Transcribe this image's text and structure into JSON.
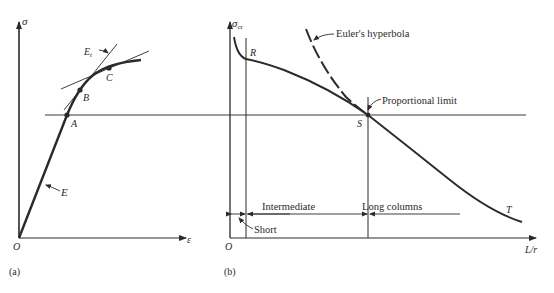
{
  "figure": {
    "panel_a": {
      "caption": "(a)",
      "y_axis_label": "σ",
      "x_axis_label": "ε",
      "origin_label": "O",
      "tangent_modulus_label": "Et",
      "elastic_modulus_label": "E",
      "points": [
        {
          "label": "A",
          "note": "proportional limit on stress-strain curve"
        },
        {
          "label": "B",
          "note": "tangent point"
        },
        {
          "label": "C",
          "note": "point on curve beyond B"
        }
      ]
    },
    "panel_b": {
      "caption": "(b)",
      "y_axis_label_main": "σ",
      "y_axis_label_sub": "cr",
      "x_axis_label": "L/r",
      "origin_label": "O",
      "curve_points": [
        {
          "label": "R"
        },
        {
          "label": "S"
        },
        {
          "label": "T"
        }
      ],
      "annotations": {
        "euler": "Euler's hyperbola",
        "proportional_limit": "Proportional limit",
        "short": "Short",
        "intermediate": "Intermediate",
        "long": "Long columns"
      }
    }
  },
  "colors": {
    "ink": "#2a2a2a",
    "background": "#ffffff"
  }
}
